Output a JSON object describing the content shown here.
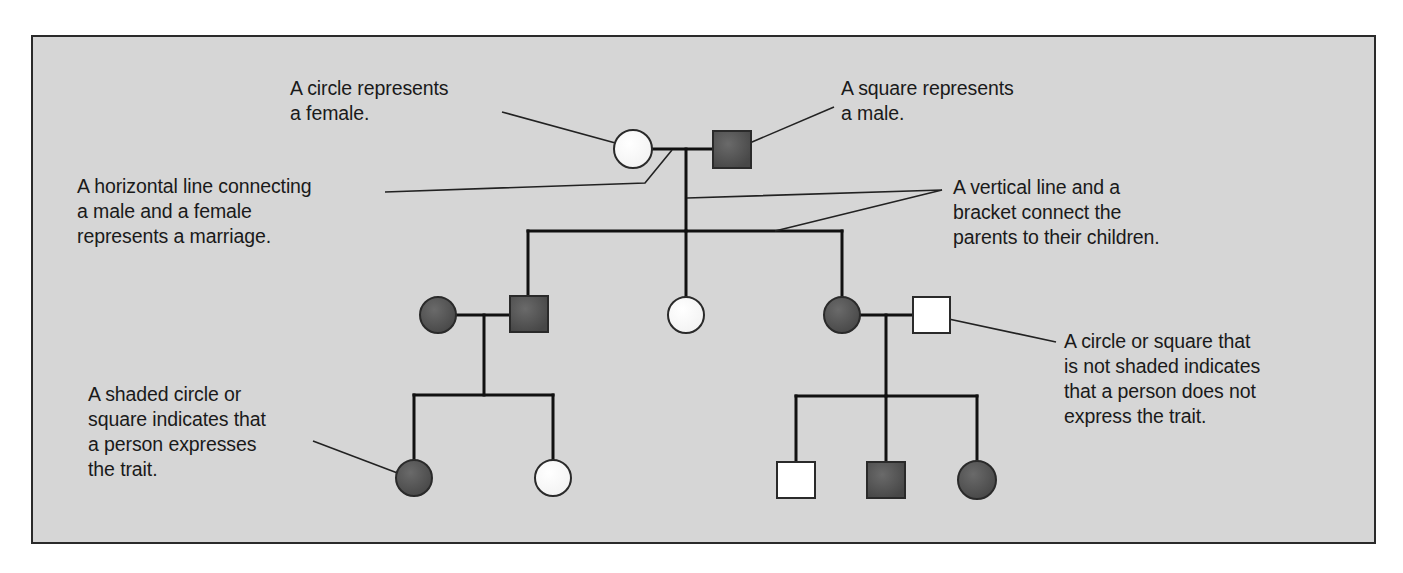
{
  "colors": {
    "panel_bg": "#d6d6d6",
    "affected_fill": "#555555",
    "unaffected_fill": "#ffffff",
    "line": "#111111",
    "text": "#1a1a1a"
  },
  "annotations": {
    "circle_female": "A circle represents\na female.",
    "square_male": "A square represents\na male.",
    "marriage_line": "A horizontal line connecting\na male and a female\nrepresents a marriage.",
    "vertical_bracket": "A vertical line and a\nbracket connect the\nparents to their children.",
    "not_shaded": "A circle or square that\nis not shaded indicates\nthat a person does not\nexpress the trait.",
    "shaded": "A shaded circle or\nsquare indicates that\na person expresses\nthe trait."
  },
  "pedigree": {
    "generation_1": [
      {
        "sex": "female",
        "shape": "circle",
        "affected": false
      },
      {
        "sex": "male",
        "shape": "square",
        "affected": true
      }
    ],
    "generation_2": [
      {
        "sex": "female",
        "shape": "circle",
        "affected": true,
        "role": "spouse"
      },
      {
        "sex": "male",
        "shape": "square",
        "affected": true,
        "role": "child"
      },
      {
        "sex": "female",
        "shape": "circle",
        "affected": false,
        "role": "child"
      },
      {
        "sex": "female",
        "shape": "circle",
        "affected": true,
        "role": "child"
      },
      {
        "sex": "male",
        "shape": "square",
        "affected": false,
        "role": "spouse"
      }
    ],
    "generation_3": [
      {
        "sex": "female",
        "shape": "circle",
        "affected": true
      },
      {
        "sex": "female",
        "shape": "circle",
        "affected": false
      },
      {
        "sex": "male",
        "shape": "square",
        "affected": false
      },
      {
        "sex": "male",
        "shape": "square",
        "affected": true
      },
      {
        "sex": "female",
        "shape": "circle",
        "affected": true
      }
    ]
  }
}
